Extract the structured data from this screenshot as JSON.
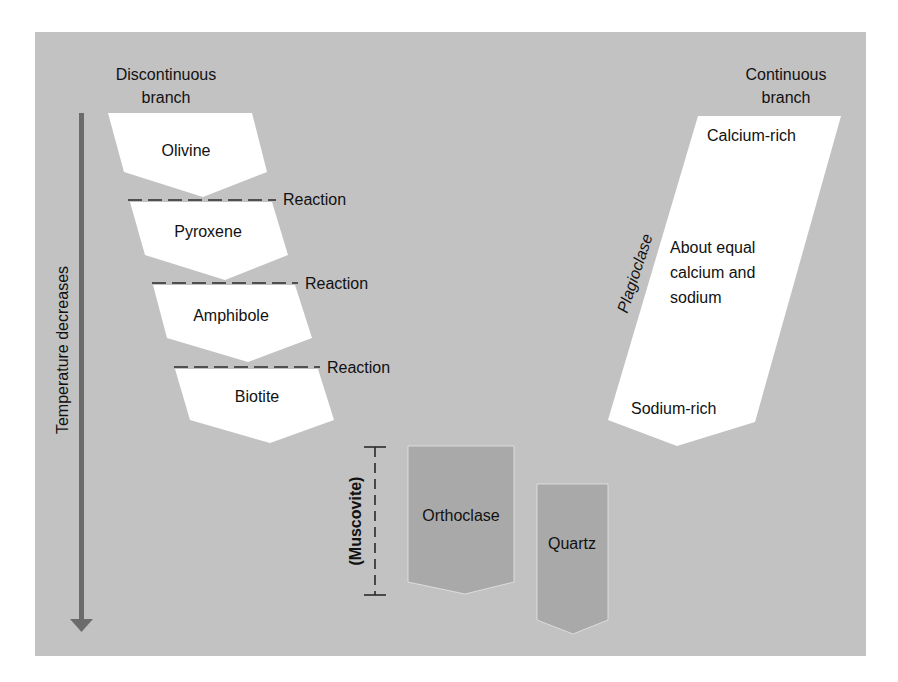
{
  "colors": {
    "page_bg": "#ffffff",
    "panel_bg": "#c2c2c2",
    "mineral_fill": "#ffffff",
    "late_mineral_fill": "#a9a9a9",
    "arrow": "#6b6b6b",
    "text": "#111111",
    "dash": "#2a2a2a"
  },
  "headers": {
    "discontinuous": [
      "Discontinuous",
      "branch"
    ],
    "continuous": [
      "Continuous",
      "branch"
    ]
  },
  "axis": {
    "label": "Temperature decreases"
  },
  "discontinuous_series": [
    {
      "name": "Olivine"
    },
    {
      "name": "Pyroxene",
      "reaction_label": "Reaction"
    },
    {
      "name": "Amphibole",
      "reaction_label": "Reaction"
    },
    {
      "name": "Biotite",
      "reaction_label": "Reaction"
    }
  ],
  "continuous_series": {
    "mineral": "Plagioclase",
    "top_label": "Calcium-rich",
    "middle_label": [
      "About equal",
      "calcium and",
      "sodium"
    ],
    "bottom_label": "Sodium-rich"
  },
  "late_minerals": {
    "muscovite_label": "(Muscovite)",
    "orthoclase": "Orthoclase",
    "quartz": "Quartz"
  }
}
